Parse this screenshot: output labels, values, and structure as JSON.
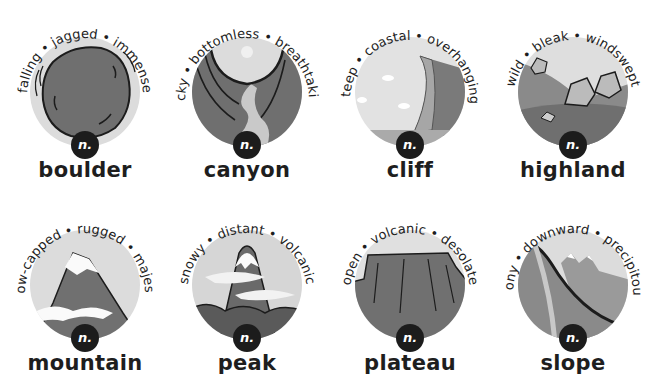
{
  "badge_label": "n.",
  "colors": {
    "ring": "#d9d9d9",
    "dark": "#1c1c1c",
    "mid": "#7a7a7a",
    "light": "#bdbdbd"
  },
  "cards": [
    {
      "word": "boulder",
      "adjectives": [
        "falling",
        "jagged",
        "immense"
      ],
      "icon": "boulder-icon"
    },
    {
      "word": "canyon",
      "adjectives": [
        "rocky",
        "bottomless",
        "breathtaking"
      ],
      "icon": "canyon-icon"
    },
    {
      "word": "cliff",
      "adjectives": [
        "steep",
        "coastal",
        "overhanging"
      ],
      "icon": "cliff-icon"
    },
    {
      "word": "highland",
      "adjectives": [
        "wild",
        "bleak",
        "windswept"
      ],
      "icon": "highland-icon"
    },
    {
      "word": "mountain",
      "adjectives": [
        "snow-capped",
        "rugged",
        "majestic"
      ],
      "icon": "mountain-icon"
    },
    {
      "word": "peak",
      "adjectives": [
        "snowy",
        "distant",
        "volcanic"
      ],
      "icon": "peak-icon"
    },
    {
      "word": "plateau",
      "adjectives": [
        "open",
        "volcanic",
        "desolate"
      ],
      "icon": "plateau-icon"
    },
    {
      "word": "slope",
      "adjectives": [
        "stony",
        "downward",
        "precipitous"
      ],
      "icon": "slope-icon"
    }
  ]
}
